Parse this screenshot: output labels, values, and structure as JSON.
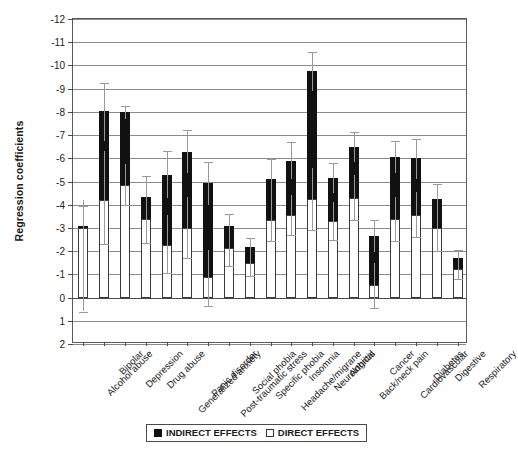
{
  "chart_data": {
    "type": "bar",
    "title": "",
    "xlabel": "",
    "ylabel": "Regression coefficients",
    "ylim": [
      -12,
      2
    ],
    "y_inverted": true,
    "grid": true,
    "yticks": [
      -12,
      -11,
      -10,
      -9,
      -8,
      -7,
      -6,
      -5,
      -4,
      -3,
      -2,
      -1,
      0,
      1,
      2
    ],
    "ytick_labels": [
      "-12",
      "-11",
      "-10",
      "-9",
      "-8",
      "-7",
      "-6",
      "-5",
      "-4",
      "-3",
      "-2",
      "-1",
      "0",
      "1",
      "2"
    ],
    "stacked": true,
    "legend_position": "bottom",
    "categories": [
      "Alcohol abuse",
      "Bipolar",
      "Depression",
      "Drug abuse",
      "Generalized anxiety",
      "Panic disorder",
      "Post-traumatic stress",
      "Social phobia",
      "Specific phobia",
      "Headache/migrane",
      "Insomnia",
      "Neurological",
      "Arthritis",
      "Back/neck pain",
      "Cancer",
      "Cardiovascular",
      "Diabetes",
      "Digestive",
      "Respiratory"
    ],
    "series": [
      {
        "name": "DIRECT EFFECTS",
        "color": "#ffffff",
        "values": [
          -3.0,
          -4.2,
          -4.85,
          -3.4,
          -2.25,
          -3.0,
          -0.9,
          -2.15,
          -1.5,
          -3.35,
          -3.55,
          -4.25,
          -3.3,
          -4.3,
          -0.55,
          -3.4,
          -3.55,
          -3.0,
          -1.25
        ]
      },
      {
        "name": "INDIRECT EFFECTS",
        "color": "#111111",
        "values": [
          -0.1,
          -3.85,
          -3.15,
          -0.95,
          -3.05,
          -3.25,
          -4.05,
          -0.95,
          -0.7,
          -1.75,
          -2.35,
          -5.5,
          -1.85,
          -2.2,
          -2.1,
          -2.65,
          -2.45,
          -1.25,
          -0.45
        ]
      }
    ],
    "totals": [
      -3.1,
      -8.05,
      -8.0,
      -4.35,
      -5.3,
      -6.25,
      -4.95,
      -3.1,
      -2.2,
      -5.1,
      -5.9,
      -9.75,
      -5.15,
      -6.5,
      -2.65,
      -6.05,
      -6.0,
      -4.25,
      -1.7
    ],
    "error_bars": {
      "description": "95% confidence intervals shown on the direct-effect top edge and on the total bar top",
      "total_low": [
        -3.95,
        -9.25,
        -8.25,
        -5.25,
        -6.3,
        -7.2,
        -5.85,
        -3.6,
        -2.55,
        -5.95,
        -6.7,
        -10.6,
        -5.8,
        -7.15,
        -3.35,
        -6.75,
        -6.85,
        -4.9,
        -2.05
      ],
      "total_high": [
        -2.3,
        -6.75,
        -7.7,
        -3.45,
        -4.3,
        -5.35,
        -4.0,
        -2.6,
        -1.85,
        -4.3,
        -5.1,
        -8.9,
        -4.5,
        -5.85,
        -1.95,
        -5.35,
        -5.1,
        -3.6,
        -1.35
      ],
      "direct_low": [
        -4.2,
        -6.3,
        -5.75,
        -4.55,
        -3.55,
        -4.35,
        -2.05,
        -2.95,
        -2.05,
        -4.3,
        -4.4,
        -5.6,
        -4.1,
        -5.3,
        -1.5,
        -4.35,
        -4.55,
        -4.0,
        -1.75
      ],
      "direct_high": [
        0.6,
        -2.3,
        -4.0,
        -2.35,
        -1.05,
        -1.7,
        0.35,
        -1.35,
        -0.95,
        -2.45,
        -2.7,
        -2.9,
        -2.5,
        -3.35,
        0.45,
        -2.45,
        -2.6,
        -2.0,
        -0.8
      ]
    }
  },
  "legend": {
    "items": [
      {
        "label": "INDIRECT EFFECTS",
        "swatch": "filled"
      },
      {
        "label": "DIRECT EFFECTS",
        "swatch": "open"
      }
    ]
  },
  "axis": {
    "y_title": "Regression coefficients"
  }
}
